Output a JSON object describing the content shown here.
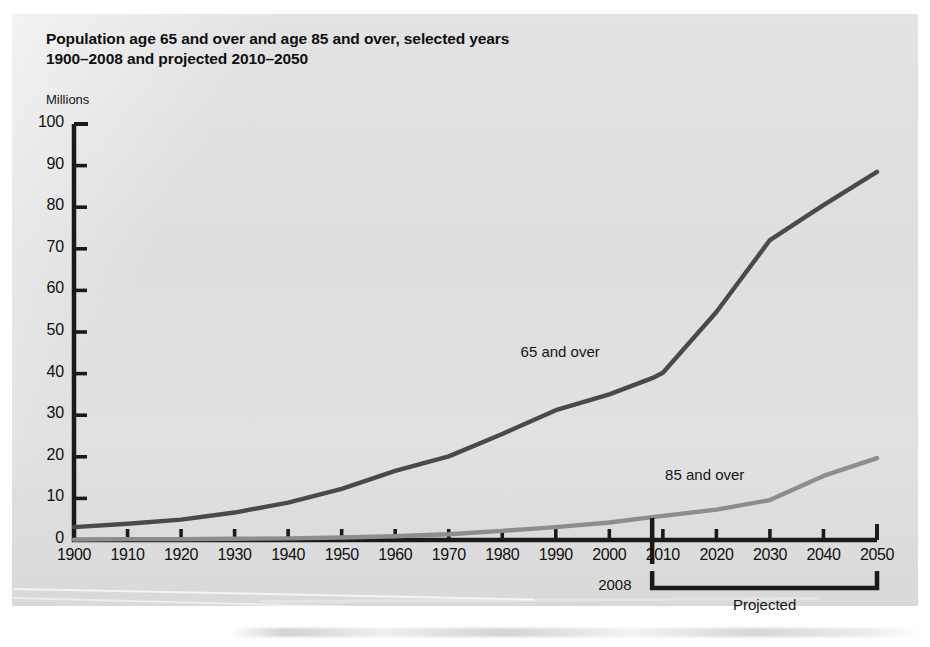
{
  "document": {
    "kind": "scanned-figure-page",
    "background_color": "#e0e0e0",
    "page_color": "#ffffff"
  },
  "chart_data": {
    "type": "line",
    "title": "Population age 65 and over and age 85 and over, selected years\n1900–2008 and projected 2010–2050",
    "title_line_1": "Population age 65 and over and age 85 and over, selected years",
    "title_line_2": "1900–2008 and projected 2010–2050",
    "xlabel": "",
    "ylabel": "Millions",
    "unit_label": "Millions",
    "grid": false,
    "legend_position": "inline-annotation",
    "xlim": [
      1900,
      2050
    ],
    "ylim": [
      0,
      100
    ],
    "xticks": [
      1900,
      1910,
      1920,
      1930,
      1940,
      1950,
      1960,
      1970,
      1980,
      1990,
      2000,
      2010,
      2020,
      2030,
      2040,
      2050
    ],
    "yticks": [
      0,
      10,
      20,
      30,
      40,
      50,
      60,
      70,
      80,
      90,
      100
    ],
    "x": [
      1900,
      1910,
      1920,
      1930,
      1940,
      1950,
      1960,
      1970,
      1980,
      1990,
      2000,
      2008,
      2010,
      2020,
      2030,
      2040,
      2050
    ],
    "series": [
      {
        "name": "65 and over",
        "color": "#4a4a4a",
        "values": [
          3.1,
          3.9,
          4.9,
          6.6,
          9.0,
          12.3,
          16.6,
          20.1,
          25.5,
          31.2,
          35.0,
          38.9,
          40.2,
          54.8,
          72.1,
          80.5,
          88.5
        ],
        "label_text": "65 and over",
        "label_year": 1995,
        "label_value": 45
      },
      {
        "name": "85 and over",
        "color": "#8d8d8d",
        "values": [
          0.1,
          0.2,
          0.2,
          0.3,
          0.4,
          0.6,
          0.9,
          1.4,
          2.2,
          3.1,
          4.2,
          5.5,
          5.8,
          7.3,
          9.6,
          15.4,
          19.7
        ],
        "label_text": "85 and over",
        "label_year": 2022,
        "label_value": 15.5
      }
    ],
    "annotations": [
      {
        "name": "projection-divider",
        "type": "vertical-rule",
        "year": 2008,
        "label": "2008"
      },
      {
        "name": "projected-bracket",
        "type": "bracket",
        "from_year": 2008,
        "to_year": 2050,
        "label": "Projected"
      }
    ]
  }
}
